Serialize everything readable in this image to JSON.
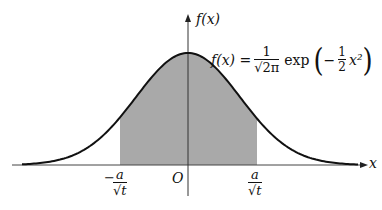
{
  "figure": {
    "y_axis_label": "f(x)",
    "x_axis_label": "x",
    "origin_label": "O",
    "formula": {
      "lhs": "f(x) =",
      "coef_num": "1",
      "coef_den": "√2π",
      "func": "exp",
      "inner_sign": "−",
      "inner_num": "1",
      "inner_den": "2",
      "inner_var": "x²"
    },
    "left_bound": {
      "sign": "−",
      "num": "a",
      "den": "√t"
    },
    "right_bound": {
      "num": "a",
      "den": "√t"
    },
    "colors": {
      "curve": "#111111",
      "shade": "#a9a9a9",
      "axis": "#333333"
    }
  },
  "chart_data": {
    "type": "area",
    "function": "f(x) = 1/sqrt(2π) · exp(-x²/2)",
    "xlabel": "x",
    "ylabel": "f(x)",
    "shaded_interval": [
      "-a/√t",
      "a/√t"
    ],
    "annotations": [
      "O",
      "-a/√t",
      "a/√t"
    ],
    "grid": false
  }
}
